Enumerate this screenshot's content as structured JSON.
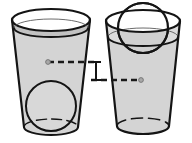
{
  "figure": {
    "title": "Two glasses each containing a sphere at different heights",
    "background_color": "#ffffff",
    "width": 192,
    "height": 143
  },
  "style": {
    "outline_color": "#141414",
    "glass_fill": "#d4d4d4",
    "glass_fill_upper": "#c9c9c9",
    "glass_fill_light": "#dedede",
    "sphere_fill_submerged": "#d8d8d8",
    "sphere_fill_exposed": "#fbfbfb",
    "dash_color": "#1a1a1a",
    "marker_dot_color": "#9a9a9a",
    "outline_width": 2,
    "thin_width": 1.4
  },
  "objects": {
    "left_glass": {
      "name": "Left glass",
      "rim_center_x": 51,
      "rim_center_y": 20,
      "rim_radius_x": 39,
      "rim_radius_y": 11,
      "base_center_x": 51,
      "base_center_y": 127,
      "base_radius_x": 27,
      "base_radius_y": 8,
      "waterline_center_y": 28,
      "waterline_radius_x": 37,
      "waterline_radius_y": 9
    },
    "right_glass": {
      "name": "Right glass",
      "rim_center_x": 143,
      "rim_center_y": 21,
      "rim_radius_x": 37,
      "rim_radius_y": 11,
      "base_center_x": 143,
      "base_center_y": 126,
      "base_radius_x": 26,
      "base_radius_y": 8,
      "waterline_center_y": 37,
      "waterline_radius_x": 35,
      "waterline_radius_y": 9
    },
    "left_sphere": {
      "name": "Sphere resting at bottom of left glass",
      "center_x": 51,
      "center_y": 106,
      "radius": 25,
      "position_label": "bottom"
    },
    "right_sphere": {
      "name": "Sphere resting at rim of right glass",
      "center_x": 143,
      "center_y": 28,
      "radius": 25,
      "position_label": "rim"
    }
  },
  "annotations": {
    "left_dashed_line": {
      "name": "Left center-height dashed line",
      "y": 62,
      "x_start": 48,
      "x_end": 96,
      "dot_x": 48,
      "dot_y": 62
    },
    "right_dashed_line": {
      "name": "Right center-height dashed line",
      "y": 80,
      "x_start": 91,
      "x_end": 141,
      "dot_x": 141,
      "dot_y": 80
    },
    "height_marker": {
      "name": "Height difference I-beam marker",
      "x": 96,
      "y_top": 62,
      "y_bottom": 80,
      "cap_half_width": 5,
      "label": ""
    }
  },
  "labels": {
    "caption": ""
  }
}
